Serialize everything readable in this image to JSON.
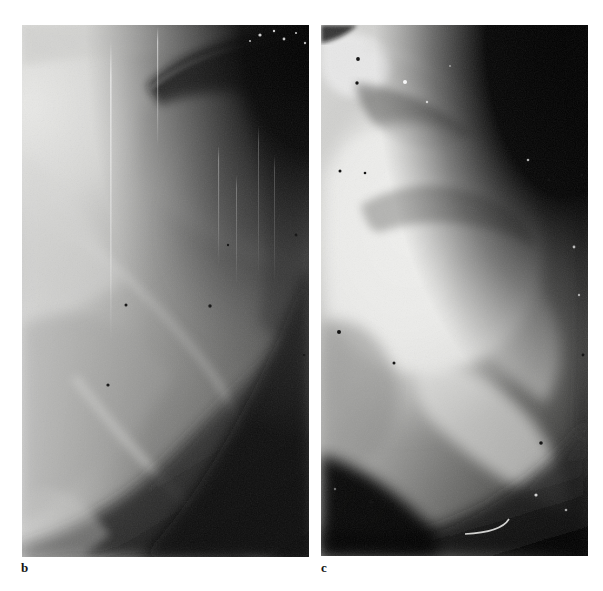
{
  "figure": {
    "type": "radiograph-figure",
    "background_color": "#ffffff",
    "panel_count": 2,
    "panels": [
      {
        "id": "b",
        "label": "b",
        "modality": "x-ray",
        "subject": "shoulder",
        "frame": {
          "x": 22,
          "y": 25,
          "width": 287,
          "height": 532
        },
        "label_position": {
          "x": 21,
          "y": 561
        },
        "description": "Radiograph of shoulder joint; bright humeral head upper left, dark soft-tissue gradient toward lower right, vertical light streak artifacts",
        "tone": {
          "highlight": "#e8e8e6",
          "midtone": "#a8a8a6",
          "shadow": "#3a3a3a",
          "deep_shadow": "#0a0a0a"
        }
      },
      {
        "id": "c",
        "label": "c",
        "modality": "x-ray",
        "subject": "shoulder",
        "frame": {
          "x": 321,
          "y": 25,
          "width": 267,
          "height": 531
        },
        "label_position": {
          "x": 321,
          "y": 561
        },
        "description": "Radiograph of shoulder joint; large bright rounded humeral head centre, black background upper right, dark band lower left with thin curved bright wire artifact",
        "tone": {
          "highlight": "#f2f2f0",
          "midtone": "#b4b4b2",
          "shadow": "#2c2c2c",
          "deep_shadow": "#050505"
        }
      }
    ]
  },
  "chart_data": {
    "type": "heatmap",
    "title": "",
    "xlabel": "",
    "ylabel": "",
    "legend": [
      "b",
      "c"
    ],
    "note": "Two grayscale radiographic images (not a quantitative plot); tone keys given per panel"
  }
}
